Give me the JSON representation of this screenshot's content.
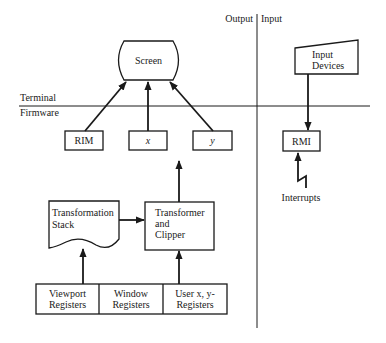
{
  "regions": {
    "output": "Output",
    "input": "Input",
    "terminal": "Terminal",
    "firmware": "Firmware"
  },
  "nodes": {
    "screen": "Screen",
    "rim": "RIM",
    "x": "x",
    "y": "y",
    "input_devices": [
      "Input",
      "Devices"
    ],
    "rmi": "RMI",
    "interrupts": "Interrupts",
    "transformation_stack": [
      "Transformation",
      "Stack"
    ],
    "transformer_clipper": [
      "Transformer",
      "and",
      "Clipper"
    ],
    "viewport_registers": [
      "Viewport",
      "Registers"
    ],
    "window_registers": [
      "Window",
      "Registers"
    ],
    "user_registers": [
      "User x, y-",
      "Registers"
    ]
  },
  "edges": [
    {
      "from": "RIM",
      "to": "Screen"
    },
    {
      "from": "x",
      "to": "Screen"
    },
    {
      "from": "y",
      "to": "Screen"
    },
    {
      "from": "Transformer and Clipper",
      "to": "x / y registers"
    },
    {
      "from": "Transformation Stack",
      "to": "Transformer and Clipper"
    },
    {
      "from": "Viewport Registers",
      "to": "Transformation Stack"
    },
    {
      "from": "User x, y- Registers",
      "to": "Transformer and Clipper"
    },
    {
      "from": "Input Devices",
      "to": "RMI"
    },
    {
      "from": "Interrupts",
      "to": "RMI"
    }
  ],
  "colors": {
    "ink": "#1a1a1a",
    "background": "#ffffff"
  }
}
